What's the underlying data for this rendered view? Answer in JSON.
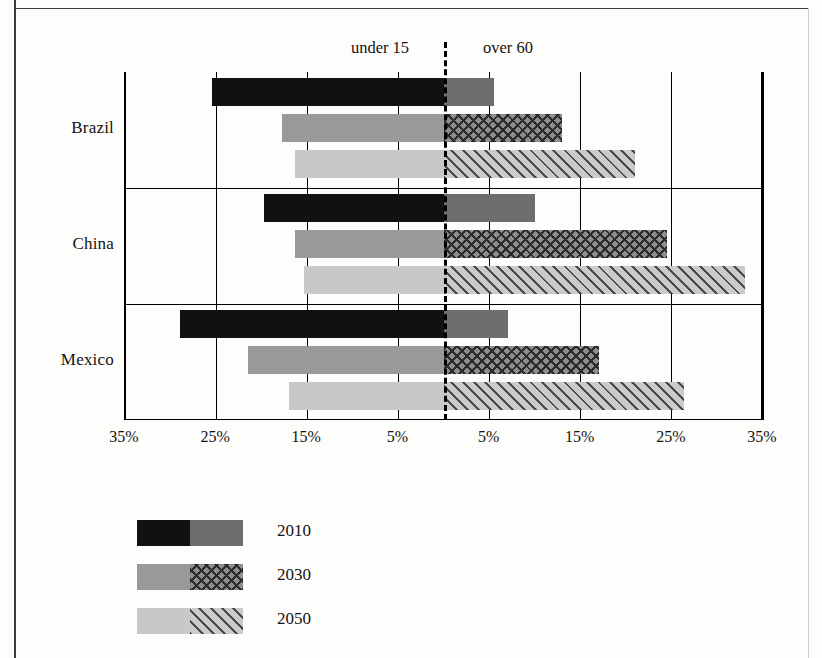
{
  "chart_data": {
    "type": "bar",
    "title": "",
    "subtitle": "",
    "orientation": "horizontal-diverging",
    "xlabel": "",
    "ylabel": "",
    "grid": true,
    "legend_position": "bottom-left",
    "side_labels": {
      "left": "under 15",
      "right": "over 60"
    },
    "axis": {
      "tick_labels": [
        "35%",
        "25%",
        "15%",
        "5%",
        "5%",
        "15%",
        "25%",
        "35%"
      ],
      "left_range": [
        35,
        0
      ],
      "right_range": [
        0,
        35
      ],
      "units": "percent of population"
    },
    "categories": [
      "Brazil",
      "China",
      "Mexico"
    ],
    "series": [
      {
        "name": "2010",
        "under_15": [
          25.5,
          19.8,
          29.0
        ],
        "over_60": [
          5.5,
          10.0,
          7.0
        ]
      },
      {
        "name": "2030",
        "under_15": [
          17.8,
          16.3,
          21.5
        ],
        "over_60": [
          13.0,
          24.5,
          17.0
        ]
      },
      {
        "name": "2050",
        "under_15": [
          16.3,
          15.4,
          17.0
        ],
        "over_60": [
          21.0,
          33.0,
          26.3
        ]
      }
    ]
  },
  "legend": {
    "items": [
      {
        "label": "2010"
      },
      {
        "label": "2030"
      },
      {
        "label": "2050"
      }
    ]
  },
  "colors": {
    "2010_under15": "#111111",
    "2010_over60": "#6e6e6e",
    "2030_under15": "#9a9a9a",
    "2030_over60": "#8d8d8d",
    "2050_under15": "#c8c8c8",
    "2050_over60": "#cacaca",
    "axis": "#000000",
    "text": "#15120f",
    "background": "#fdfdfc"
  }
}
